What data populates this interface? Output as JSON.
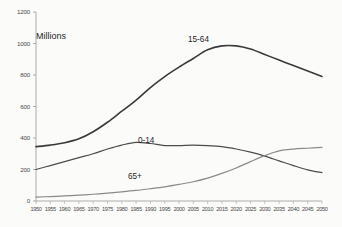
{
  "chart_data": {
    "type": "line",
    "title": "",
    "subtitle": "",
    "xlabel": "",
    "ylabel": "Millions",
    "ylim": [
      0,
      1200
    ],
    "ytick_step": 200,
    "yticks": [
      "0",
      "200",
      "400",
      "600",
      "800",
      "1000",
      "1200"
    ],
    "grid": false,
    "legend_position": "inline-annotations",
    "x": [
      1950,
      1955,
      1960,
      1965,
      1970,
      1975,
      1980,
      1985,
      1990,
      1995,
      2000,
      2005,
      2010,
      2015,
      2020,
      2025,
      2030,
      2035,
      2040,
      2045,
      2050
    ],
    "xtick_labels": [
      "1950",
      "1955",
      "1960",
      "1965",
      "1970",
      "1975",
      "1980",
      "1985",
      "1990",
      "1995",
      "2000",
      "2005",
      "2010",
      "2015",
      "2020",
      "2025",
      "2030",
      "2035",
      "2040",
      "2045",
      "2050"
    ],
    "series": [
      {
        "name": "15-64",
        "color": "#3a3a3a",
        "width": 1.6,
        "annotation": "15-64",
        "values": [
          345,
          355,
          370,
          395,
          440,
          500,
          570,
          640,
          720,
          790,
          850,
          905,
          960,
          985,
          985,
          965,
          930,
          895,
          860,
          825,
          790
        ]
      },
      {
        "name": "0-14",
        "color": "#4c4c4c",
        "width": 1.2,
        "annotation": "0-14",
        "values": [
          200,
          225,
          250,
          275,
          300,
          330,
          355,
          372,
          365,
          352,
          352,
          355,
          352,
          345,
          330,
          310,
          285,
          255,
          225,
          198,
          180
        ]
      },
      {
        "name": "65+",
        "color": "#8a8a8a",
        "width": 1.2,
        "annotation": "65+",
        "values": [
          25,
          28,
          32,
          37,
          43,
          50,
          58,
          67,
          78,
          90,
          105,
          122,
          145,
          175,
          210,
          250,
          288,
          318,
          330,
          335,
          340
        ]
      }
    ]
  },
  "annotations": {
    "series_15_64": "15-64",
    "series_0_14": "0-14",
    "series_65_plus": "65+",
    "axis_unit": "Millions"
  }
}
